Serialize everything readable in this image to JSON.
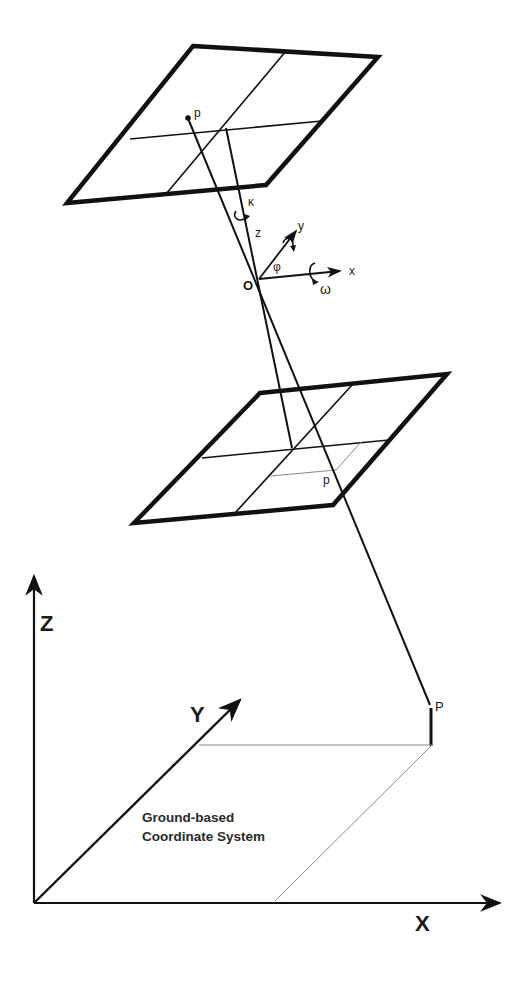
{
  "diagram": {
    "labels": {
      "image_point_top": "p",
      "image_point_mid": "p",
      "ground_point": "P",
      "perspective_center": "O",
      "kappa": "κ",
      "phi": "φ",
      "omega": "ω",
      "camera_x": "x",
      "camera_y": "y",
      "camera_z": "z",
      "ground_X": "X",
      "ground_Y": "Y",
      "ground_Z": "Z",
      "caption_line1": "Ground-based",
      "caption_line2": "Coordinate System"
    },
    "components": [
      "negative image plane (above O)",
      "positive image plane (below O)",
      "perspective center O with rotation axes x,y,z and angles ω,φ,κ",
      "ground point P",
      "ground-based coordinate system X,Y,Z"
    ],
    "colors": {
      "stroke": "#111111",
      "thin_stroke": "#777777",
      "background": "#ffffff"
    }
  }
}
